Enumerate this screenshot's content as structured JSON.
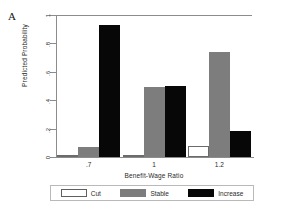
{
  "panel": {
    "letter": "A"
  },
  "axes": {
    "ylabel": "Predicted Probability",
    "xlabel": "Benefit-Wage Ratio",
    "yticks": [
      "0",
      ".2",
      ".4",
      ".6",
      ".8",
      "1"
    ],
    "xticks": [
      ".7",
      "1",
      "1.2"
    ]
  },
  "legend": {
    "entries": [
      {
        "label": "Cut",
        "color": "#ffffff",
        "key": "cut"
      },
      {
        "label": "Stable",
        "color": "#7d7d7d",
        "key": "stable"
      },
      {
        "label": "Increase",
        "color": "#070707",
        "key": "increase"
      }
    ]
  },
  "chart_data": {
    "type": "bar",
    "title": "",
    "xlabel": "Benefit-Wage Ratio",
    "ylabel": "Predicted Probability",
    "categories": [
      ".7",
      "1",
      "1.2"
    ],
    "ylim": [
      0,
      1
    ],
    "yticks": [
      0,
      0.2,
      0.4,
      0.6,
      0.8,
      1
    ],
    "grid": false,
    "legend_position": "bottom",
    "series": [
      {
        "name": "Cut",
        "color": "#ffffff",
        "values": [
          0.0,
          0.01,
          0.08
        ]
      },
      {
        "name": "Stable",
        "color": "#7d7d7d",
        "values": [
          0.07,
          0.49,
          0.74
        ]
      },
      {
        "name": "Increase",
        "color": "#070707",
        "values": [
          0.93,
          0.5,
          0.18
        ]
      }
    ]
  }
}
